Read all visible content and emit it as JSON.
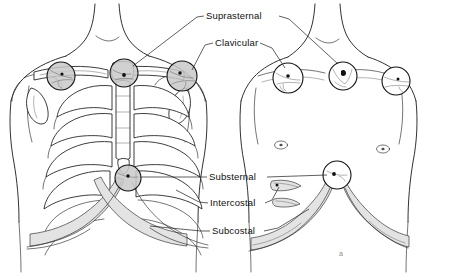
{
  "figure": {
    "background_color": "#ffffff",
    "ink_color": "#1b1b1b",
    "shade_color": "#d8d8d8",
    "figure_mark": "a",
    "panels": [
      {
        "id": "left-panel",
        "name": "skeletal-torso",
        "description": "Anterior torso with rib cage, clavicles, sternum and costal margin"
      },
      {
        "id": "right-panel",
        "name": "surface-torso",
        "description": "Anterior torso surface anatomy showing retraction hollows"
      }
    ]
  },
  "labels": [
    {
      "id": "suprasternal",
      "text": "Suprasternal",
      "x": 206,
      "y": 19
    },
    {
      "id": "clavicular",
      "text": "Clavicular",
      "x": 215,
      "y": 46
    },
    {
      "id": "substernal",
      "text": "Substernal",
      "x": 209,
      "y": 180
    },
    {
      "id": "intercostal",
      "text": "Intercostal",
      "x": 210,
      "y": 206
    },
    {
      "id": "subcostal",
      "text": "Subcostal",
      "x": 212,
      "y": 234
    }
  ],
  "markers": {
    "left_panel_sites": [
      {
        "id": "clavicular-left",
        "cx": 61,
        "cy": 76,
        "r": 14,
        "style": "shaded"
      },
      {
        "id": "suprasternal",
        "cx": 124,
        "cy": 73,
        "r": 14,
        "style": "shaded"
      },
      {
        "id": "clavicular-right",
        "cx": 182,
        "cy": 76,
        "r": 15,
        "style": "shaded"
      },
      {
        "id": "substernal",
        "cx": 128,
        "cy": 178,
        "r": 13,
        "style": "shaded"
      }
    ],
    "right_panel_sites": [
      {
        "id": "clavicular-left",
        "cx": 288,
        "cy": 78,
        "r": 15,
        "style": "open"
      },
      {
        "id": "suprasternal",
        "cx": 343,
        "cy": 76,
        "r": 14,
        "style": "open"
      },
      {
        "id": "clavicular-right",
        "cx": 396,
        "cy": 81,
        "r": 14,
        "style": "open"
      },
      {
        "id": "substernal",
        "cx": 337,
        "cy": 175,
        "r": 14,
        "style": "open"
      }
    ]
  }
}
